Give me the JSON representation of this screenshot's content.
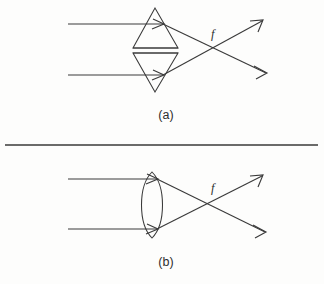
{
  "figure": {
    "type": "optics-ray-diagram",
    "background_color": "#fdfdfc",
    "stroke_color": "#3a3a3a",
    "panels": [
      {
        "id": "panel-a",
        "label": "(a)",
        "label_x": 166,
        "label_y": 119,
        "optic_name": "paired-prisms",
        "focal_label": "f",
        "focal_label_x": 211,
        "focal_label_y": 38,
        "focal_point_x": 219,
        "focal_point_y": 50,
        "incoming_rays": [
          {
            "x1": 68,
            "y1": 24,
            "x2": 163,
            "y2": 24
          },
          {
            "x1": 68,
            "y1": 75,
            "x2": 163,
            "y2": 75
          }
        ],
        "outgoing_rays": [
          {
            "x1": 163,
            "y1": 24,
            "x2": 266,
            "y2": 73
          },
          {
            "x1": 163,
            "y1": 75,
            "x2": 262,
            "y2": 21
          }
        ],
        "optic_shapes": {
          "upper_prism": "155,8 133,48 178,48",
          "lower_prism": "155,92 133,53 178,53",
          "upper_base_line": {
            "x1": 133,
            "y1": 48,
            "x2": 178,
            "y2": 48
          },
          "lower_base_line": {
            "x1": 133,
            "y1": 53,
            "x2": 178,
            "y2": 53
          }
        }
      },
      {
        "id": "panel-b",
        "label": "(b)",
        "label_x": 166,
        "label_y": 266,
        "optic_name": "biconvex-lens",
        "focal_label": "f",
        "focal_label_x": 211,
        "focal_label_y": 192,
        "focal_point_x": 219,
        "focal_point_y": 204,
        "incoming_rays": [
          {
            "x1": 68,
            "y1": 179,
            "x2": 155,
            "y2": 179
          },
          {
            "x1": 68,
            "y1": 229,
            "x2": 155,
            "y2": 229
          }
        ],
        "outgoing_rays": [
          {
            "x1": 155,
            "y1": 179,
            "x2": 265,
            "y2": 232
          },
          {
            "x1": 155,
            "y1": 229,
            "x2": 262,
            "y2": 177
          }
        ],
        "optic_shapes": {
          "lens_center_x": 152,
          "lens_top_y": 172,
          "lens_bottom_y": 238,
          "lens_half_width": 14
        }
      }
    ],
    "divider": {
      "x1": 5,
      "y1": 145,
      "x2": 318,
      "y2": 145
    }
  }
}
